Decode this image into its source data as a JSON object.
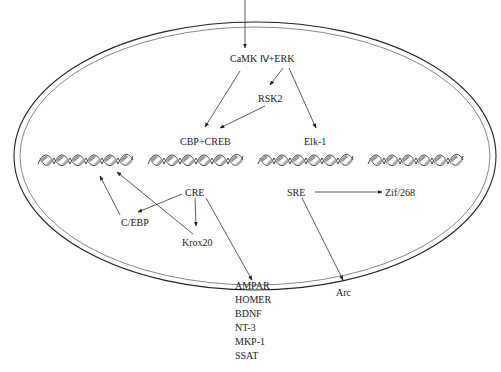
{
  "nodes": {
    "camk_erk": "CaMK Ⅳ+ERK",
    "rsk2": "RSK2",
    "cbp_creb": "CBP+CREB",
    "elk1": "Elk-1",
    "cre": "CRE",
    "cebp": "C/EBP",
    "krox20": "Krox20",
    "sre": "SRE",
    "zif268": "Zif/268",
    "arc": "Arc"
  },
  "target_genes": [
    "AMPAR",
    "HOMER",
    "BDNF",
    "NT-3",
    "MKP-1",
    "SSAT"
  ],
  "edges": [
    {
      "from": "external-signal",
      "to": "camk_erk"
    },
    {
      "from": "camk_erk",
      "to": "cbp_creb"
    },
    {
      "from": "camk_erk",
      "to": "rsk2"
    },
    {
      "from": "camk_erk",
      "to": "elk1"
    },
    {
      "from": "rsk2",
      "to": "cbp_creb"
    },
    {
      "from": "cre",
      "to": "cebp"
    },
    {
      "from": "cre",
      "to": "krox20"
    },
    {
      "from": "cre",
      "to": "target_genes"
    },
    {
      "from": "cebp",
      "to": "dna-helix-1"
    },
    {
      "from": "krox20",
      "to": "dna-helix-1"
    },
    {
      "from": "sre",
      "to": "zif268"
    },
    {
      "from": "sre",
      "to": "arc"
    }
  ],
  "dna_helix_count": 4
}
